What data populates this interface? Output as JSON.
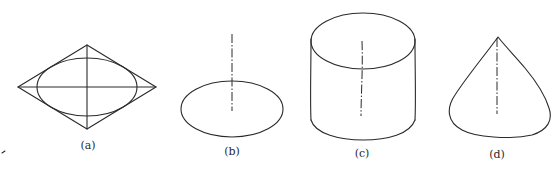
{
  "figure": {
    "panels": [
      {
        "id": "a",
        "label": "(a)",
        "shape": "ellipse inscribed in rhombus with crossing axes"
      },
      {
        "id": "b",
        "label": "(b)",
        "shape": "flat ellipse with vertical dash-dot axis"
      },
      {
        "id": "c",
        "label": "(c)",
        "shape": "cylinder with vertical dash-dot axis"
      },
      {
        "id": "d",
        "label": "(d)",
        "shape": "cone with vertical dash-dot axis"
      }
    ],
    "colors": {
      "stroke": "#2a2a2a",
      "background": "#ffffff"
    }
  }
}
